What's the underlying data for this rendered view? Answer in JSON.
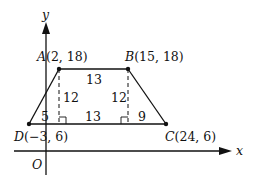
{
  "axes": {
    "x_label": "x",
    "y_label": "y",
    "origin_label": "O"
  },
  "points": {
    "A": {
      "letter": "A",
      "coords": "(2, 18)"
    },
    "B": {
      "letter": "B",
      "coords": "(15, 18)"
    },
    "C": {
      "letter": "C",
      "coords": "(24, 6)"
    },
    "D": {
      "letter": "D",
      "coords": "(−3, 6)"
    }
  },
  "measurements": {
    "top_base": "13",
    "left_height": "12",
    "right_height": "12",
    "bottom_middle": "13",
    "bottom_left": "5",
    "bottom_right": "9"
  },
  "colors": {
    "stroke": "#111111",
    "background": "#ffffff"
  }
}
